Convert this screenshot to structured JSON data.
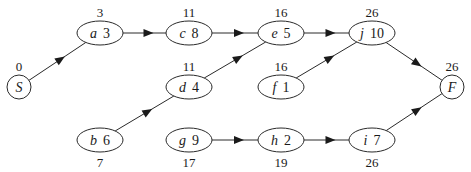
{
  "diagram": {
    "type": "activity-network",
    "nodes": [
      {
        "id": "S",
        "name": "S",
        "duration": "",
        "time": "0",
        "shape": "circle",
        "cx": 19,
        "cy": 87,
        "label_pos": "above"
      },
      {
        "id": "a",
        "name": "a",
        "duration": "3",
        "time": "3",
        "shape": "ellipse",
        "cx": 100,
        "cy": 33,
        "label_pos": "above"
      },
      {
        "id": "b",
        "name": "b",
        "duration": "6",
        "time": "7",
        "shape": "ellipse",
        "cx": 100,
        "cy": 140,
        "label_pos": "below"
      },
      {
        "id": "c",
        "name": "c",
        "duration": "8",
        "time": "11",
        "shape": "ellipse",
        "cx": 189,
        "cy": 33,
        "label_pos": "above"
      },
      {
        "id": "d",
        "name": "d",
        "duration": "4",
        "time": "11",
        "shape": "ellipse",
        "cx": 189,
        "cy": 87,
        "label_pos": "above"
      },
      {
        "id": "g",
        "name": "g",
        "duration": "9",
        "time": "17",
        "shape": "ellipse",
        "cx": 189,
        "cy": 140,
        "label_pos": "below"
      },
      {
        "id": "e",
        "name": "e",
        "duration": "5",
        "time": "16",
        "shape": "ellipse",
        "cx": 281,
        "cy": 33,
        "label_pos": "above"
      },
      {
        "id": "f",
        "name": "f",
        "duration": "1",
        "time": "16",
        "shape": "ellipse",
        "cx": 281,
        "cy": 87,
        "label_pos": "above"
      },
      {
        "id": "h",
        "name": "h",
        "duration": "2",
        "time": "19",
        "shape": "ellipse",
        "cx": 281,
        "cy": 140,
        "label_pos": "below"
      },
      {
        "id": "j",
        "name": "j",
        "duration": "10",
        "time": "26",
        "shape": "ellipse",
        "cx": 372,
        "cy": 33,
        "label_pos": "above"
      },
      {
        "id": "i",
        "name": "i",
        "duration": "7",
        "time": "26",
        "shape": "ellipse",
        "cx": 372,
        "cy": 140,
        "label_pos": "below"
      },
      {
        "id": "F",
        "name": "F",
        "duration": "",
        "time": "26",
        "shape": "circle",
        "cx": 452,
        "cy": 87,
        "label_pos": "above"
      }
    ],
    "edges": [
      {
        "from": "S",
        "to": "a"
      },
      {
        "from": "a",
        "to": "c"
      },
      {
        "from": "c",
        "to": "e"
      },
      {
        "from": "d",
        "to": "e"
      },
      {
        "from": "b",
        "to": "d"
      },
      {
        "from": "e",
        "to": "j"
      },
      {
        "from": "f",
        "to": "j"
      },
      {
        "from": "j",
        "to": "F"
      },
      {
        "from": "g",
        "to": "h"
      },
      {
        "from": "h",
        "to": "i"
      },
      {
        "from": "i",
        "to": "F"
      }
    ]
  }
}
